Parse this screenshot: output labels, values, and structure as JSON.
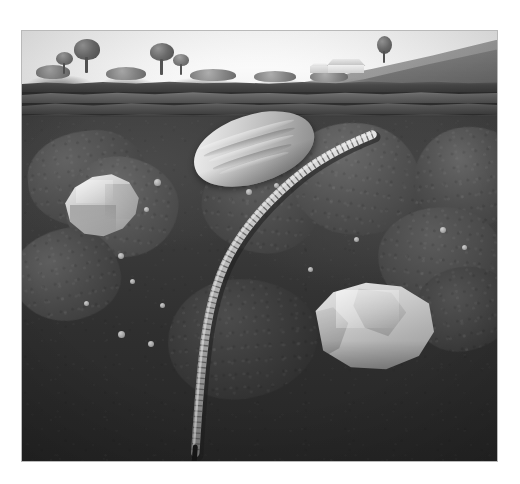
{
  "figure": {
    "medium": "grayscale airbrush illustration"
  },
  "plate": {
    "frame_color": "#b9b9b9",
    "background_color": "#ffffff",
    "left": 21,
    "top": 30,
    "width": 477,
    "height": 432
  },
  "sky": {
    "label": "sky",
    "color_top": "#ffffff",
    "color_bottom": "#f4f4f4"
  },
  "landscape": {
    "label": "surface landscape",
    "hill": {
      "label": "sloping hillside",
      "color": "#a8a8a8"
    },
    "trees": [
      {
        "label": "tree-left",
        "x": 52,
        "y": 8,
        "crown_w": 26,
        "crown_h": 20
      },
      {
        "label": "tree-left-small",
        "x": 36,
        "y": 20,
        "crown_w": 16,
        "crown_h": 12
      },
      {
        "label": "tree-center",
        "x": 128,
        "y": 12,
        "crown_w": 24,
        "crown_h": 17
      },
      {
        "label": "tree-center-small",
        "x": 152,
        "y": 22,
        "crown_w": 15,
        "crown_h": 11
      },
      {
        "label": "tree-by-house",
        "x": 355,
        "y": 6,
        "crown_w": 14,
        "crown_h": 16
      }
    ],
    "shrubs": [
      {
        "label": "shrub-a",
        "x": 14,
        "y": 34,
        "w": 34,
        "h": 14
      },
      {
        "label": "shrub-b",
        "x": 84,
        "y": 36,
        "w": 40,
        "h": 13
      },
      {
        "label": "shrub-c",
        "x": 168,
        "y": 38,
        "w": 46,
        "h": 12
      },
      {
        "label": "shrub-d",
        "x": 232,
        "y": 40,
        "w": 42,
        "h": 11
      },
      {
        "label": "shrub-e",
        "x": 288,
        "y": 40,
        "w": 38,
        "h": 11
      }
    ],
    "farmhouse": {
      "label": "farmhouse",
      "x": 300,
      "y": 28,
      "w": 44,
      "h": 16
    }
  },
  "horizons": [
    {
      "id": "O",
      "label": "turf / organic layer",
      "color": "#4a4a4a",
      "top": 48,
      "height": 13
    },
    {
      "id": "A",
      "label": "topsoil horizon",
      "color": "#6a6a6a",
      "top": 58,
      "height": 14
    },
    {
      "id": "B",
      "label": "subsoil horizon",
      "color": "#585858",
      "top": 68,
      "height": 15
    },
    {
      "id": "C",
      "label": "weathered parent band",
      "color": "#3c3c3c",
      "top": 79,
      "height": 14
    }
  ],
  "subsoil": {
    "label": "subsoil matrix",
    "color_top": "#3e3e3e",
    "color_bottom": "#262626"
  },
  "boulders": [
    {
      "label": "boulder-upper-left",
      "x": 6,
      "y": 100,
      "w": 120,
      "h": 96,
      "shade": "#4f4f4f",
      "rot": -6
    },
    {
      "label": "boulder-left-mid",
      "x": 44,
      "y": 126,
      "w": 112,
      "h": 100,
      "shade": "#565656",
      "rot": 8
    },
    {
      "label": "boulder-left-low",
      "x": -10,
      "y": 198,
      "w": 108,
      "h": 92,
      "shade": "#4a4a4a",
      "rot": -12
    },
    {
      "label": "boulder-center-upper",
      "x": 180,
      "y": 118,
      "w": 120,
      "h": 104,
      "shade": "#4c4c4c",
      "rot": 5
    },
    {
      "label": "boulder-center-low",
      "x": 146,
      "y": 248,
      "w": 150,
      "h": 120,
      "shade": "#3a3a3a",
      "rot": -4
    },
    {
      "label": "boulder-right-upper",
      "x": 268,
      "y": 92,
      "w": 132,
      "h": 112,
      "shade": "#525252",
      "rot": 10
    },
    {
      "label": "boulder-right-edge",
      "x": 392,
      "y": 96,
      "w": 110,
      "h": 100,
      "shade": "#4e4e4e",
      "rot": -8
    },
    {
      "label": "boulder-right-mid",
      "x": 356,
      "y": 176,
      "w": 128,
      "h": 106,
      "shade": "#4a4a4a",
      "rot": 6
    },
    {
      "label": "boulder-right-low",
      "x": 392,
      "y": 236,
      "w": 100,
      "h": 84,
      "shade": "#414141",
      "rot": -10
    }
  ],
  "rocks": [
    {
      "label": "pale angular rock",
      "kind": "light weathered stone",
      "x": 40,
      "y": 142,
      "w": 78,
      "h": 64,
      "highlight_color": "#f2f2f2",
      "shadow_color": "#8e8e8e"
    },
    {
      "label": "crystalline quartz rock",
      "kind": "bright crystal cluster",
      "x": 288,
      "y": 250,
      "w": 124,
      "h": 92,
      "highlight_color": "#ededed",
      "shadow_color": "#949494"
    }
  ],
  "seed": {
    "label": "germinating seed",
    "x": 170,
    "y": 84,
    "w": 124,
    "h": 68,
    "rotation_deg": -17,
    "ridge_count": 4,
    "highlight_color": "#f1f1f1",
    "shadow_color": "#878787"
  },
  "root": {
    "label": "segmented root",
    "stroke_color": "#bdbdbd",
    "shadow_color": "#2a2a2a",
    "segment_count": 68,
    "path": "M352,104 C332,112 300,126 272,150 C246,172 224,196 208,226 C194,252 186,286 182,324 C178,360 176,392 174,424",
    "tip": {
      "x": 174,
      "y": 424
    }
  },
  "pebbles": [
    {
      "label": "pebble-1",
      "x": 132,
      "y": 148,
      "d": 7
    },
    {
      "label": "pebble-2",
      "x": 122,
      "y": 176,
      "d": 5
    },
    {
      "label": "pebble-3",
      "x": 224,
      "y": 158,
      "d": 6
    },
    {
      "label": "pebble-4",
      "x": 252,
      "y": 152,
      "d": 5
    },
    {
      "label": "pebble-5",
      "x": 96,
      "y": 222,
      "d": 6
    },
    {
      "label": "pebble-6",
      "x": 108,
      "y": 248,
      "d": 5
    },
    {
      "label": "pebble-7",
      "x": 138,
      "y": 272,
      "d": 5
    },
    {
      "label": "pebble-8",
      "x": 96,
      "y": 300,
      "d": 7
    },
    {
      "label": "pebble-9",
      "x": 126,
      "y": 310,
      "d": 6
    },
    {
      "label": "pebble-10",
      "x": 418,
      "y": 196,
      "d": 6
    },
    {
      "label": "pebble-11",
      "x": 440,
      "y": 214,
      "d": 5
    },
    {
      "label": "pebble-12",
      "x": 286,
      "y": 236,
      "d": 5
    },
    {
      "label": "pebble-13",
      "x": 62,
      "y": 270,
      "d": 5
    },
    {
      "label": "pebble-14",
      "x": 332,
      "y": 206,
      "d": 5
    }
  ]
}
